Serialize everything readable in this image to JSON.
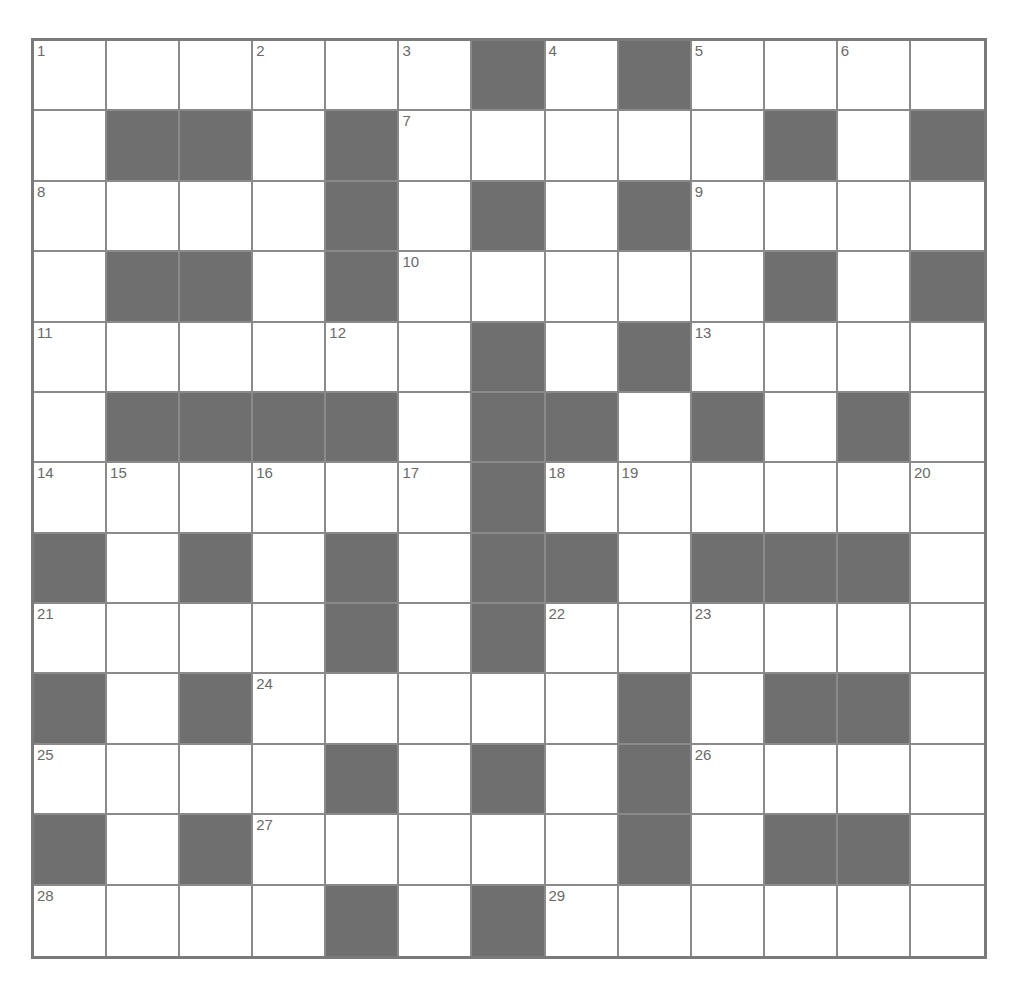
{
  "puzzle": {
    "rows": 13,
    "cols": 13,
    "colors": {
      "block": "#6f6f6f",
      "cell": "#ffffff",
      "line": "#8a8a8a",
      "border": "#7a7a7a",
      "number": "#6a6a6a"
    },
    "grid": [
      "......#.#....",
      ".##.#.....#.#",
      "....#.#.#....",
      ".##.#.....#.#",
      "......#.#....",
      ".####.##.#.#.",
      "......#......",
      "#.#.#.##.###.",
      "....#.#......",
      "#.#.....#.##.",
      "....#.#.#....",
      "#.#.....#.##.",
      "....#.#......"
    ],
    "numbers": [
      {
        "r": 0,
        "c": 0,
        "n": "1"
      },
      {
        "r": 0,
        "c": 3,
        "n": "2"
      },
      {
        "r": 0,
        "c": 5,
        "n": "3"
      },
      {
        "r": 0,
        "c": 7,
        "n": "4"
      },
      {
        "r": 0,
        "c": 9,
        "n": "5"
      },
      {
        "r": 0,
        "c": 11,
        "n": "6"
      },
      {
        "r": 1,
        "c": 5,
        "n": "7"
      },
      {
        "r": 2,
        "c": 0,
        "n": "8"
      },
      {
        "r": 2,
        "c": 9,
        "n": "9"
      },
      {
        "r": 3,
        "c": 5,
        "n": "10"
      },
      {
        "r": 4,
        "c": 0,
        "n": "11"
      },
      {
        "r": 4,
        "c": 4,
        "n": "12"
      },
      {
        "r": 4,
        "c": 9,
        "n": "13"
      },
      {
        "r": 6,
        "c": 0,
        "n": "14"
      },
      {
        "r": 6,
        "c": 1,
        "n": "15"
      },
      {
        "r": 6,
        "c": 3,
        "n": "16"
      },
      {
        "r": 6,
        "c": 5,
        "n": "17"
      },
      {
        "r": 6,
        "c": 7,
        "n": "18"
      },
      {
        "r": 6,
        "c": 8,
        "n": "19"
      },
      {
        "r": 6,
        "c": 12,
        "n": "20"
      },
      {
        "r": 8,
        "c": 0,
        "n": "21"
      },
      {
        "r": 8,
        "c": 7,
        "n": "22"
      },
      {
        "r": 8,
        "c": 9,
        "n": "23"
      },
      {
        "r": 9,
        "c": 3,
        "n": "24"
      },
      {
        "r": 10,
        "c": 0,
        "n": "25"
      },
      {
        "r": 10,
        "c": 9,
        "n": "26"
      },
      {
        "r": 11,
        "c": 3,
        "n": "27"
      },
      {
        "r": 12,
        "c": 0,
        "n": "28"
      },
      {
        "r": 12,
        "c": 7,
        "n": "29"
      }
    ]
  }
}
